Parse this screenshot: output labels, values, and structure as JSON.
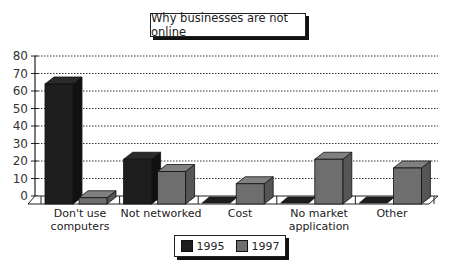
{
  "chart_data": {
    "type": "bar",
    "title": "Why businesses are not online",
    "categories": [
      "Don't use computers",
      "Not networked",
      "Cost",
      "No market application",
      "Other"
    ],
    "category_lines": [
      [
        "Don't use",
        "computers"
      ],
      [
        "Not networked"
      ],
      [
        "Cost"
      ],
      [
        "No market",
        "application"
      ],
      [
        "Other"
      ]
    ],
    "series": [
      {
        "name": "1995",
        "values": [
          68,
          25,
          0,
          0,
          0
        ],
        "color": "#1e1e1e"
      },
      {
        "name": "1997",
        "values": [
          3,
          18,
          11,
          25,
          20
        ],
        "color": "#6e6e6e"
      }
    ],
    "xlabel": "",
    "ylabel": "",
    "ylim": [
      0,
      80
    ],
    "yticks": [
      0,
      10,
      20,
      30,
      40,
      50,
      60,
      70,
      80
    ],
    "grid": true,
    "legend_position": "bottom",
    "style": "3d"
  },
  "title": "Why businesses are not online",
  "legend": {
    "items": [
      {
        "label": "1995",
        "color": "#1e1e1e"
      },
      {
        "label": "1997",
        "color": "#6e6e6e"
      }
    ]
  },
  "labels": {
    "cat0_l1": "Don't use",
    "cat0_l2": "computers",
    "cat1_l1": "Not networked",
    "cat2_l1": "Cost",
    "cat3_l1": "No market",
    "cat3_l2": "application",
    "cat4_l1": "Other"
  }
}
